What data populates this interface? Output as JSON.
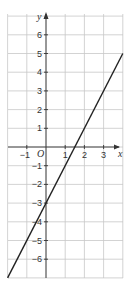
{
  "chart_data": {
    "type": "line",
    "title": "",
    "xlabel": "x",
    "ylabel": "y",
    "origin_label": "O",
    "xlim": [
      -2,
      4
    ],
    "ylim": [
      -7,
      7
    ],
    "grid": true,
    "x_ticks": [
      -1,
      1,
      2,
      3
    ],
    "y_ticks": [
      6,
      5,
      4,
      3,
      2,
      1,
      -1,
      -2,
      -3,
      -4,
      -5,
      -6
    ],
    "x_tick_labels": [
      "−1",
      "1",
      "2",
      "3"
    ],
    "y_tick_labels": [
      "6",
      "5",
      "4",
      "3",
      "2",
      "1",
      "−1",
      "−2",
      "−3",
      "−4",
      "−5",
      "−6"
    ],
    "series": [
      {
        "name": "y = 2x − 3",
        "x": [
          -2,
          4
        ],
        "y": [
          -7,
          5
        ]
      }
    ],
    "annotations": {
      "y_intercept": -3,
      "x_intercept": 1.5
    }
  },
  "colors": {
    "grid": "#c8c8c8",
    "axis": "#333333",
    "line": "#222222"
  },
  "layout": {
    "origin_px": [
      46,
      147
    ],
    "unit_x_px": 19.2,
    "unit_y_px": 18.7,
    "grid_left": 8,
    "grid_right": 123,
    "grid_top": 14,
    "grid_bottom": 278
  }
}
